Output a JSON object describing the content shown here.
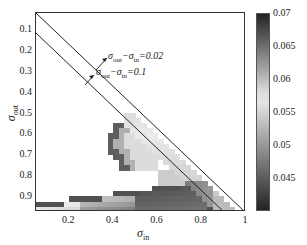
{
  "chart_data": {
    "type": "heatmap",
    "title": "",
    "xlabel": "σ_in",
    "ylabel": "σ_out",
    "x_ticks": [
      "0.2",
      "0.4",
      "0.6",
      "0.8",
      "1"
    ],
    "y_ticks": [
      "0.1",
      "0.2",
      "0.3",
      "0.4",
      "0.5",
      "0.6",
      "0.7",
      "0.8",
      "0.9"
    ],
    "xlim": [
      0.05,
      1.0
    ],
    "ylim": [
      0.97,
      0.02
    ],
    "y_inverted": true,
    "colorbar": {
      "ticks": [
        "0.07",
        "0.065",
        "0.06",
        "0.055",
        "0.05",
        "0.045"
      ],
      "range": [
        0.04,
        0.07
      ],
      "colormap": "gray-diverging (dark at both ends, light near 0.057)"
    },
    "annotations": [
      {
        "label": "σ_out − σ_in = 0.02",
        "line": "y = x + 0.02"
      },
      {
        "label": "σ_out − σ_in = 0.1",
        "line": "y = x + 0.1"
      }
    ],
    "regions": [
      {
        "description": "Upper-left triangle (σ_out < σ_in) blank/white",
        "value": null
      },
      {
        "description": "Cluster near σ_in≈0.4-0.55, σ_out≈0.5-0.75, dark left edge to light interior",
        "value_range": [
          0.045,
          0.06
        ]
      },
      {
        "description": "Bottom band σ_out≈0.85-0.97 across σ_in, dark stripe top edge, darker toward σ_in 0.5-0.8",
        "value_range": [
          0.042,
          0.068
        ]
      },
      {
        "description": "Strip along diagonal between the two lines, light gray",
        "value_range": [
          0.055,
          0.06
        ]
      }
    ]
  },
  "labels": {
    "ann1_main": "σ",
    "ann1_s1": "out",
    "ann1_mid": "−σ",
    "ann1_s2": "in",
    "ann1_val": "=0.02",
    "ann2_val": "=0.1",
    "xlabel_main": "σ",
    "xlabel_sub": "in",
    "ylabel_main": "σ",
    "ylabel_sub": "out"
  }
}
